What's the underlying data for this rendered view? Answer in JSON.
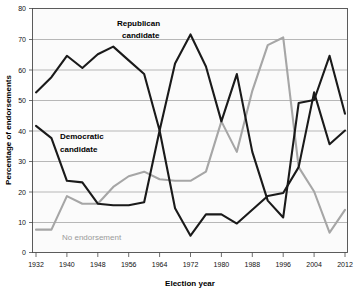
{
  "chart_data": {
    "type": "line",
    "title": "",
    "xlabel": "Election year",
    "ylabel": "Percentage of endorsements",
    "xlim": [
      1932,
      2012
    ],
    "ylim": [
      0,
      80
    ],
    "grid": true,
    "legend": "inline-annotations",
    "x": [
      1932,
      1936,
      1940,
      1944,
      1948,
      1952,
      1956,
      1960,
      1964,
      1968,
      1972,
      1976,
      1980,
      1984,
      1988,
      1992,
      1996,
      2000,
      2004,
      2008,
      2012
    ],
    "xtick_labels": [
      "1932",
      "1940",
      "1948",
      "1956",
      "1964",
      "1972",
      "1980",
      "1988",
      "1996",
      "2004",
      "2008",
      "2012"
    ],
    "ytick_labels": [
      "0",
      "10",
      "20",
      "30",
      "40",
      "50",
      "60",
      "70",
      "80"
    ],
    "series": [
      {
        "name": "Republican candidate",
        "color": "#1a1a1a",
        "values": [
          52.5,
          57.5,
          64.5,
          60.5,
          65,
          67.5,
          63,
          58.5,
          40,
          62,
          71.5,
          61,
          43,
          58.5,
          33,
          17,
          11.5,
          49,
          50,
          64.5,
          45.5
        ],
        "label_x": 1966,
        "label_y": 78
      },
      {
        "name": "Democratic candidate",
        "color": "#1a1a1a",
        "values": [
          41.5,
          37.5,
          23.5,
          23,
          16,
          15.5,
          15.5,
          16.5,
          40,
          14.5,
          5.5,
          12.5,
          12.5,
          9.5,
          14,
          18.5,
          19.5,
          28,
          52.5,
          35.5,
          40
        ],
        "label_x": 1940,
        "label_y": 42
      },
      {
        "name": "No endorsement",
        "color": "#a6a6a6",
        "values": [
          7.5,
          7.5,
          18.5,
          16,
          16,
          21.5,
          25,
          26.5,
          24,
          23.5,
          23.5,
          26.5,
          43,
          33,
          53,
          68,
          70.5,
          28,
          20,
          6.5,
          14
        ],
        "label_x": 1948,
        "label_y": 6
      }
    ],
    "annotations": [
      {
        "id": "republican-label",
        "text_line1": "Republican",
        "text_line2": "candidate"
      },
      {
        "id": "democratic-label",
        "text_line1": "Democratic",
        "text_line2": "candidate"
      },
      {
        "id": "no-endorsement-label",
        "text_line1": "No endorsement",
        "text_line2": ""
      }
    ]
  },
  "axes": {
    "x_title": "Election year",
    "y_title": "Percentage of endorsements"
  }
}
